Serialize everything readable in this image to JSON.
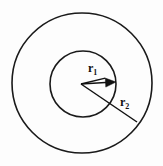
{
  "figure": {
    "background_color": "#fdfdfd",
    "stroke_color": "#1a1a1a",
    "label_color": "#111111"
  },
  "labels": {
    "inner_radius": {
      "symbol": "r",
      "subscript": "1",
      "text": "r1"
    },
    "outer_radius": {
      "symbol": "r",
      "subscript": "2",
      "text": "r2"
    }
  },
  "chart_data": {
    "type": "diagram",
    "subtype": "concentric-circles",
    "units": "pixels",
    "center": {
      "x": 82,
      "y": 83
    },
    "shapes": [
      {
        "name": "outer-circle",
        "kind": "circle",
        "cx": 82,
        "cy": 83,
        "r": 70,
        "fill": "none",
        "stroke": "#1a1a1a",
        "stroke_width": 1.6
      },
      {
        "name": "inner-circle",
        "kind": "circle",
        "cx": 83,
        "cy": 84,
        "r": 33,
        "fill": "none",
        "stroke": "#1a1a1a",
        "stroke_width": 1.6
      }
    ],
    "radii": [
      {
        "name": "r1",
        "label": "r1",
        "from": {
          "x": 81,
          "y": 84
        },
        "to": {
          "x": 116,
          "y": 82
        },
        "length_px": 35,
        "has_arrowhead": true,
        "arrow_direction": "right",
        "label_position": {
          "x": 88,
          "y": 62
        }
      },
      {
        "name": "r2",
        "label": "r2",
        "from": {
          "x": 81,
          "y": 84
        },
        "to": {
          "x": 137,
          "y": 122
        },
        "length_px": 68,
        "has_arrowhead": false,
        "arrow_direction": "down-right",
        "label_position": {
          "x": 120,
          "y": 96
        }
      }
    ],
    "legend": [],
    "grid": false
  }
}
